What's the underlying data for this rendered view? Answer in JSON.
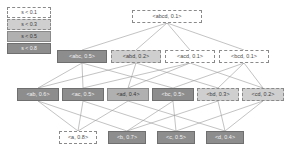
{
  "figure": {
    "type": "itemset-support-lattice",
    "width": 293,
    "height": 156,
    "background": "#ffffff"
  },
  "legend": {
    "name": "support-threshold-legend",
    "rows": [
      {
        "label": "s < 0.1",
        "band": 0,
        "fill": "#ffffff",
        "border": "#8a8a8a",
        "style": "dashed"
      },
      {
        "label": "s < 0.3",
        "band": 1,
        "fill": "#cfcfcf",
        "border": "#8a8a8a",
        "style": "dashed"
      },
      {
        "label": "s < 0.5",
        "band": 2,
        "fill": "#b0b0b0",
        "border": "#8a8a8a",
        "style": "solid"
      },
      {
        "label": "s < 0.8",
        "band": 3,
        "fill": "#8d8d8d",
        "border": "#6f6f6f",
        "style": "solid"
      }
    ]
  },
  "chart_data": {
    "type": "diagram",
    "title": "",
    "levels": [
      {
        "level": 0,
        "name": "four-itemsets"
      },
      {
        "level": 1,
        "name": "three-itemsets"
      },
      {
        "level": 2,
        "name": "two-itemsets"
      },
      {
        "level": 3,
        "name": "one-itemsets"
      }
    ],
    "nodes": [
      {
        "id": "abcd",
        "label": "<abcd, 0.1>",
        "itemset": "abcd",
        "support": 0.1,
        "band": 0,
        "x": 132,
        "y": 10,
        "w": 70,
        "h": 13,
        "level": 0
      },
      {
        "id": "abc",
        "label": "<abc, 0.5>",
        "itemset": "abc",
        "support": 0.5,
        "band": 3,
        "x": 57,
        "y": 50,
        "w": 50,
        "h": 13,
        "level": 1
      },
      {
        "id": "abd",
        "label": "<abd, 0.2>",
        "itemset": "abd",
        "support": 0.2,
        "band": 1,
        "x": 111,
        "y": 50,
        "w": 50,
        "h": 13,
        "level": 1
      },
      {
        "id": "acd",
        "label": "<acd, 0.1>",
        "itemset": "acd",
        "support": 0.1,
        "band": 0,
        "x": 165,
        "y": 50,
        "w": 50,
        "h": 13,
        "level": 1
      },
      {
        "id": "bcd",
        "label": "<bcd, 0.1>",
        "itemset": "bcd",
        "support": 0.1,
        "band": 0,
        "x": 219,
        "y": 50,
        "w": 50,
        "h": 13,
        "level": 1
      },
      {
        "id": "ab",
        "label": "<ab, 0.6>",
        "itemset": "ab",
        "support": 0.6,
        "band": 3,
        "x": 17,
        "y": 88,
        "w": 42,
        "h": 13,
        "level": 2
      },
      {
        "id": "ac",
        "label": "<ac, 0.5>",
        "itemset": "ac",
        "support": 0.5,
        "band": 3,
        "x": 62,
        "y": 88,
        "w": 42,
        "h": 13,
        "level": 2
      },
      {
        "id": "ad",
        "label": "<ad, 0.4>",
        "itemset": "ad",
        "support": 0.4,
        "band": 2,
        "x": 107,
        "y": 88,
        "w": 42,
        "h": 13,
        "level": 2
      },
      {
        "id": "bc",
        "label": "<bc, 0.5>",
        "itemset": "bc",
        "support": 0.5,
        "band": 3,
        "x": 152,
        "y": 88,
        "w": 42,
        "h": 13,
        "level": 2
      },
      {
        "id": "bd",
        "label": "<bd, 0.3>",
        "itemset": "bd",
        "support": 0.3,
        "band": 1,
        "x": 197,
        "y": 88,
        "w": 42,
        "h": 13,
        "level": 2
      },
      {
        "id": "cd",
        "label": "<cd, 0.2>",
        "itemset": "cd",
        "support": 0.2,
        "band": 1,
        "x": 242,
        "y": 88,
        "w": 42,
        "h": 13,
        "level": 2
      },
      {
        "id": "a",
        "label": "<a, 0.8>",
        "itemset": "a",
        "support": 0.8,
        "band": 0,
        "x": 59,
        "y": 131,
        "w": 38,
        "h": 13,
        "level": 3
      },
      {
        "id": "b",
        "label": "<b, 0.7>",
        "itemset": "b",
        "support": 0.7,
        "band": 3,
        "x": 108,
        "y": 131,
        "w": 38,
        "h": 13,
        "level": 3
      },
      {
        "id": "c",
        "label": "<c, 0.5>",
        "itemset": "c",
        "support": 0.5,
        "band": 3,
        "x": 157,
        "y": 131,
        "w": 38,
        "h": 13,
        "level": 3
      },
      {
        "id": "d",
        "label": "<d, 0.4>",
        "itemset": "d",
        "support": 0.4,
        "band": 3,
        "x": 206,
        "y": 131,
        "w": 38,
        "h": 13,
        "level": 3
      }
    ],
    "edges": [
      {
        "from": "abcd",
        "to": "abc"
      },
      {
        "from": "abcd",
        "to": "abd"
      },
      {
        "from": "abcd",
        "to": "acd"
      },
      {
        "from": "abcd",
        "to": "bcd"
      },
      {
        "from": "abc",
        "to": "ab"
      },
      {
        "from": "abc",
        "to": "ac"
      },
      {
        "from": "abc",
        "to": "bc"
      },
      {
        "from": "abd",
        "to": "ab"
      },
      {
        "from": "abd",
        "to": "ad"
      },
      {
        "from": "abd",
        "to": "bd"
      },
      {
        "from": "acd",
        "to": "ac"
      },
      {
        "from": "acd",
        "to": "ad"
      },
      {
        "from": "acd",
        "to": "cd"
      },
      {
        "from": "bcd",
        "to": "bc"
      },
      {
        "from": "bcd",
        "to": "bd"
      },
      {
        "from": "bcd",
        "to": "cd"
      },
      {
        "from": "ab",
        "to": "a"
      },
      {
        "from": "ab",
        "to": "b"
      },
      {
        "from": "ac",
        "to": "a"
      },
      {
        "from": "ac",
        "to": "c"
      },
      {
        "from": "ad",
        "to": "a"
      },
      {
        "from": "ad",
        "to": "d"
      },
      {
        "from": "bc",
        "to": "b"
      },
      {
        "from": "bc",
        "to": "c"
      },
      {
        "from": "bd",
        "to": "b"
      },
      {
        "from": "bd",
        "to": "d"
      },
      {
        "from": "cd",
        "to": "c"
      },
      {
        "from": "cd",
        "to": "d"
      }
    ],
    "edge_color": "#9a9a9a",
    "edge_width": 0.6
  }
}
